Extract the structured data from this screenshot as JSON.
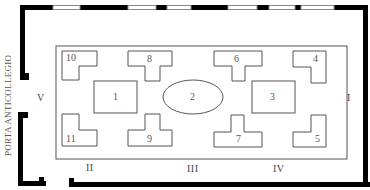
{
  "side_label": "PORTA ANTICOLLEGIO",
  "walls": {
    "left": "V",
    "right": "I",
    "bottom": [
      "II",
      "III",
      "IV"
    ]
  },
  "furniture": [
    {
      "id": "10",
      "label": "10"
    },
    {
      "id": "8",
      "label": "8"
    },
    {
      "id": "6",
      "label": "6"
    },
    {
      "id": "4",
      "label": "4"
    },
    {
      "id": "1",
      "label": "1"
    },
    {
      "id": "2",
      "label": "2"
    },
    {
      "id": "3",
      "label": "3"
    },
    {
      "id": "11",
      "label": "11"
    },
    {
      "id": "9",
      "label": "9"
    },
    {
      "id": "7",
      "label": "7"
    },
    {
      "id": "5",
      "label": "5"
    }
  ],
  "colors": {
    "wall": "#000000",
    "line": "#555555",
    "window": "#999999"
  }
}
